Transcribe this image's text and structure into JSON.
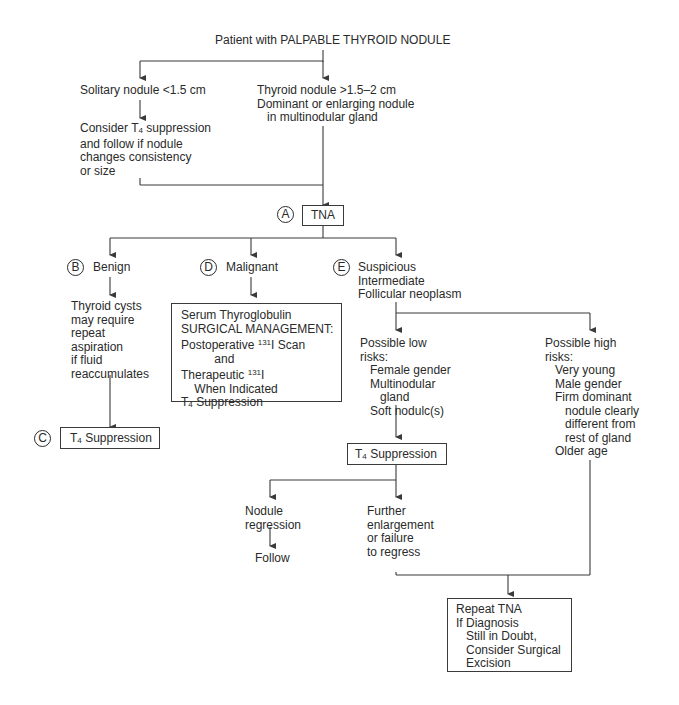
{
  "root": {
    "label": "Patient with PALPABLE THYROID NODULE"
  },
  "small_nodule": {
    "label": "Solitary nodule <1.5 cm",
    "action_lines": [
      "Consider T",
      "4",
      " suppression",
      "and follow if nodule",
      "changes consistency",
      "or size"
    ]
  },
  "large_nodule": {
    "lines": [
      "Thyroid nodule >1.5–2 cm",
      "Dominant or enlarging nodule",
      "in multinodular gland"
    ]
  },
  "tna": {
    "marker": "A",
    "label": "TNA"
  },
  "benign": {
    "marker": "B",
    "label": "Benign",
    "note_lines": [
      "Thyroid cysts",
      "may require",
      "repeat",
      "aspiration",
      "if fluid",
      "reaccumulates"
    ]
  },
  "benign_outcome": {
    "marker": "C",
    "label_prefix": "T",
    "label_sub": "4",
    "label_suffix": " Suppression"
  },
  "malignant": {
    "marker": "D",
    "label": "Malignant",
    "box": {
      "line1": "Serum Thyroglobulin",
      "line2": "SURGICAL MANAGEMENT:",
      "line3_prefix": "Postoperative ",
      "line3_sup": "131",
      "line3_suffix": "I Scan",
      "line4": "and",
      "line5_prefix": "Therapeutic ",
      "line5_sup": "131",
      "line5_suffix": "I",
      "line6": "When Indicated",
      "line7_prefix": "T",
      "line7_sub": "4",
      "line7_suffix": " Suppression"
    }
  },
  "suspicious": {
    "marker": "E",
    "lines": [
      "Suspicious",
      "Intermediate",
      "Follicular neoplasm"
    ]
  },
  "low_risk": {
    "title_lines": [
      "Possible low",
      "risks:"
    ],
    "items": [
      "Female gender",
      "Multinodular",
      "gland",
      "Soft nodulc(s)"
    ]
  },
  "high_risk": {
    "title_lines": [
      "Possible high",
      "risks:"
    ],
    "items": [
      "Very young",
      "Male gender",
      "Firm dominant",
      "nodule clearly",
      "different from",
      "rest of gland",
      "Older age"
    ]
  },
  "low_risk_action": {
    "label_prefix": "T",
    "label_sub": "4",
    "label_suffix": " Suppression"
  },
  "regression": {
    "lines": [
      "Nodule",
      "regression"
    ],
    "outcome": "Follow"
  },
  "enlargement": {
    "lines": [
      "Further",
      "enlargement",
      "or failure",
      "to regress"
    ]
  },
  "final": {
    "lines": [
      "Repeat TNA",
      "If Diagnosis",
      "Still in Doubt,",
      "Consider Surgical",
      "Excision"
    ]
  },
  "colors": {
    "line": "#3a3a3a",
    "text": "#2a2a2a",
    "background": "#ffffff"
  }
}
